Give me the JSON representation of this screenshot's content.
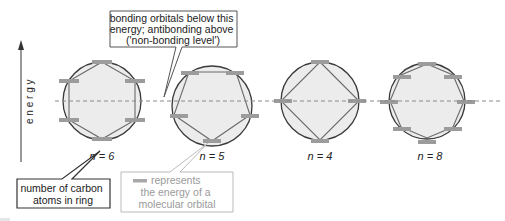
{
  "axis": {
    "label": "e n e r g y",
    "direction": "up"
  },
  "non_bonding_level": {
    "style": "dashed",
    "color": "#8a8a8a"
  },
  "callouts": {
    "nonbonding": {
      "lines": [
        "bonding orbitals below this",
        "energy; antibonding above",
        "('non-bonding level')"
      ]
    },
    "carbon_count": {
      "lines": [
        "number of carbon",
        "atoms in ring"
      ]
    },
    "orbital_legend": {
      "lines": [
        "represents",
        "the energy of a",
        "molecular orbital"
      ],
      "swatch_color": "#a8a8a8"
    }
  },
  "rings": [
    {
      "n": 6,
      "label": "n = 6",
      "orbitals": 6
    },
    {
      "n": 5,
      "label": "n = 5",
      "orbitals": 5
    },
    {
      "n": 4,
      "label": "n = 4",
      "orbitals": 4
    },
    {
      "n": 8,
      "label": "n = 8",
      "orbitals": 8
    }
  ],
  "colors": {
    "circle_stroke": "#3a3a3a",
    "circle_fill": "#ececec",
    "polygon_stroke": "#6a6a6a",
    "orbital_bar": "#9c9c9c",
    "text": "#222222",
    "legend_text": "#9a9a9a"
  }
}
